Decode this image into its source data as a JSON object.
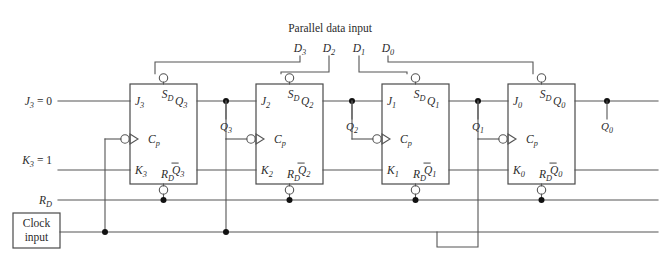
{
  "figure": {
    "type": "logic-circuit-schematic",
    "colors": {
      "wire": "#555555",
      "box_stroke": "#4a4a4a",
      "text": "#2b2b2b",
      "junction": "#111111",
      "background": "#ffffff"
    }
  },
  "top_header": {
    "title": "Parallel data input",
    "pins": [
      {
        "name": "D3",
        "base": "D",
        "sub": "3",
        "x": 300
      },
      {
        "name": "D2",
        "base": "D",
        "sub": "2",
        "x": 329
      },
      {
        "name": "D1",
        "base": "D",
        "sub": "1",
        "x": 359
      },
      {
        "name": "D0",
        "base": "D",
        "sub": "0",
        "x": 388
      }
    ]
  },
  "left_inputs": [
    {
      "name": "J3-input",
      "base": "J",
      "sub": "3",
      "value": "= 0",
      "text": "J3 = 0",
      "y": 101
    },
    {
      "name": "K3-input",
      "base": "K",
      "sub": "3",
      "value": "= 1",
      "text": "K3 = 1",
      "y": 160
    },
    {
      "name": "RD-input",
      "base": "R",
      "sub": "D",
      "value": "",
      "text": "RD",
      "y": 200
    }
  ],
  "clock_box": {
    "line1": "Clock",
    "line2": "input"
  },
  "flipflops": [
    {
      "name": "flipflop-3",
      "x": 130,
      "y": 84,
      "w": 67,
      "h": 100,
      "pins": {
        "j": {
          "base": "J",
          "sub": "3"
        },
        "k": {
          "base": "K",
          "sub": "3"
        },
        "cp": {
          "base": "C",
          "sub": "p"
        },
        "sd": {
          "base": "S",
          "sub": "D"
        },
        "rd": {
          "base": "R",
          "sub": "D"
        },
        "q": {
          "base": "Q",
          "sub": "3",
          "bar": false
        },
        "qn": {
          "base": "Q",
          "sub": "3",
          "bar": true
        }
      }
    },
    {
      "name": "flipflop-2",
      "x": 256,
      "y": 84,
      "w": 67,
      "h": 100,
      "pins": {
        "j": {
          "base": "J",
          "sub": "2"
        },
        "k": {
          "base": "K",
          "sub": "2"
        },
        "cp": {
          "base": "C",
          "sub": "p"
        },
        "sd": {
          "base": "S",
          "sub": "D"
        },
        "rd": {
          "base": "R",
          "sub": "D"
        },
        "q": {
          "base": "Q",
          "sub": "2",
          "bar": false
        },
        "qn": {
          "base": "Q",
          "sub": "2",
          "bar": true
        }
      }
    },
    {
      "name": "flipflop-1",
      "x": 382,
      "y": 84,
      "w": 67,
      "h": 100,
      "pins": {
        "j": {
          "base": "J",
          "sub": "1"
        },
        "k": {
          "base": "K",
          "sub": "1"
        },
        "cp": {
          "base": "C",
          "sub": "p"
        },
        "sd": {
          "base": "S",
          "sub": "D"
        },
        "rd": {
          "base": "R",
          "sub": "D"
        },
        "q": {
          "base": "Q",
          "sub": "1",
          "bar": false
        },
        "qn": {
          "base": "Q",
          "sub": "1",
          "bar": true
        }
      }
    },
    {
      "name": "flipflop-0",
      "x": 508,
      "y": 84,
      "w": 67,
      "h": 100,
      "pins": {
        "j": {
          "base": "J",
          "sub": "0"
        },
        "k": {
          "base": "K",
          "sub": "0"
        },
        "cp": {
          "base": "C",
          "sub": "p"
        },
        "sd": {
          "base": "S",
          "sub": "D"
        },
        "rd": {
          "base": "R",
          "sub": "D"
        },
        "q": {
          "base": "Q",
          "sub": "0",
          "bar": false
        },
        "qn": {
          "base": "Q",
          "sub": "0",
          "bar": true
        }
      }
    }
  ],
  "node_labels": [
    {
      "name": "node-Q3",
      "base": "Q",
      "sub": "3",
      "x": 226,
      "y": 130
    },
    {
      "name": "node-Q2",
      "base": "Q",
      "sub": "2",
      "x": 352,
      "y": 130
    },
    {
      "name": "node-Q1",
      "base": "Q",
      "sub": "1",
      "x": 478,
      "y": 130
    },
    {
      "name": "node-Q0",
      "base": "Q",
      "sub": "0",
      "x": 607,
      "y": 130
    }
  ]
}
